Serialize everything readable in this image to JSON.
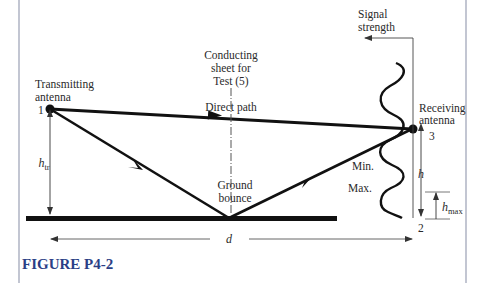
{
  "figure": {
    "caption": "FIGURE P4-2",
    "colors": {
      "caption": "#2b3f86",
      "frame": "#9aa0b4",
      "ink": "#111111",
      "thin_line": "#555555"
    }
  },
  "labels": {
    "transmitting_antenna_line1": "Transmitting",
    "transmitting_antenna_line2": "antenna",
    "receiving_antenna_line1": "Receiving",
    "receiving_antenna_line2": "antenna",
    "conducting_sheet_line1": "Conducting",
    "conducting_sheet_line2": "sheet for",
    "conducting_sheet_line3": "Test (5)",
    "direct_path": "Direct path",
    "ground_bounce_line1": "Ground",
    "ground_bounce_line2": "bounce",
    "signal_strength_line1": "Signal",
    "signal_strength_line2": "strength",
    "min": "Min.",
    "max": "Max.",
    "point_1": "1",
    "point_2": "2",
    "point_3": "3",
    "h_tr_main": "h",
    "h_tr_sub": "tr",
    "h": "h",
    "h_max_main": "h",
    "h_max_sub": "max",
    "d": "d"
  }
}
